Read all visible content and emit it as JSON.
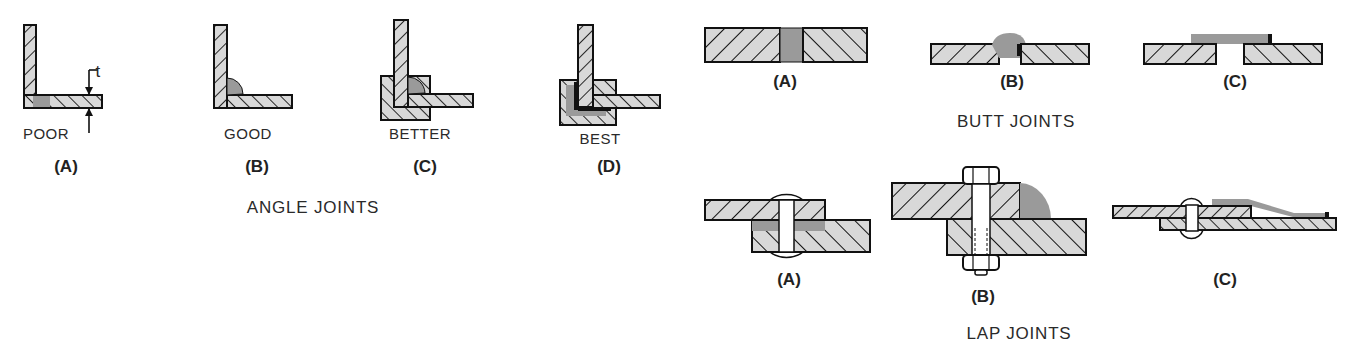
{
  "colors": {
    "metal_fill": "#d8d8d8",
    "weld_fill": "#9a9a9a",
    "outline": "#111111",
    "background": "#ffffff"
  },
  "angle_joints": {
    "group_label": "ANGLE JOINTS",
    "dimension_label": "t",
    "items": [
      {
        "tag": "(A)",
        "rating": "POOR"
      },
      {
        "tag": "(B)",
        "rating": "GOOD"
      },
      {
        "tag": "(C)",
        "rating": "BETTER"
      },
      {
        "tag": "(D)",
        "rating": "BEST"
      }
    ]
  },
  "butt_joints": {
    "group_label": "BUTT JOINTS",
    "items": [
      {
        "tag": "(A)"
      },
      {
        "tag": "(B)"
      },
      {
        "tag": "(C)"
      }
    ]
  },
  "lap_joints": {
    "group_label": "LAP JOINTS",
    "items": [
      {
        "tag": "(A)"
      },
      {
        "tag": "(B)"
      },
      {
        "tag": "(C)"
      }
    ]
  }
}
